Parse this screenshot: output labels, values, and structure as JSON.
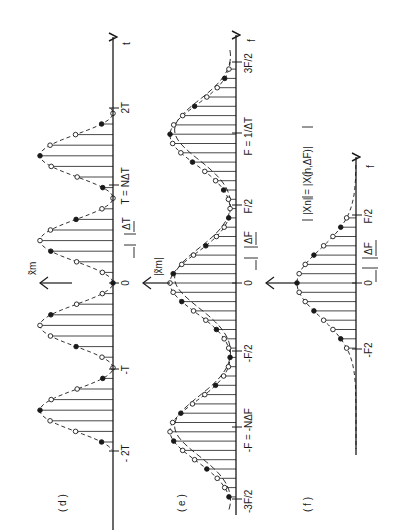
{
  "figure": {
    "orientation": "rotated-90-ccw",
    "ink_color": "#1a1a1a",
    "background": "#ffffff"
  },
  "panels": [
    {
      "id": "d",
      "label": "( d )",
      "y_axis_label": "x̃m",
      "x_axis_label": "t",
      "ticks": [
        {
          "text": "2T",
          "pos": 108
        },
        {
          "text": "T = NΔT",
          "pos": 185
        },
        {
          "text": "0",
          "pos": 283
        },
        {
          "text": "-T",
          "pos": 369
        },
        {
          "text": "- 2T",
          "pos": 451
        }
      ],
      "spacing_label": "ΔT",
      "baseline_x": 113,
      "peak_x": 40,
      "axis_top": 37,
      "axis_bottom": 530,
      "period_px": 85,
      "sample_spacing_px": 10.6
    },
    {
      "id": "e",
      "label": "( e )",
      "y_axis_label": "|x̃m|",
      "x_axis_label": "f",
      "ticks": [
        {
          "text": "3F/2",
          "pos": 62
        },
        {
          "text": "F = 1/ΔT",
          "pos": 133
        },
        {
          "text": "F/2",
          "pos": 205
        },
        {
          "text": "0",
          "pos": 283
        },
        {
          "text": "-F/2",
          "pos": 351
        },
        {
          "text": "-F = -NΔF",
          "pos": 427
        },
        {
          "text": "-3F/2",
          "pos": 499
        }
      ],
      "spacing_label": "ΔF",
      "baseline_x": 236,
      "peak_x": 170,
      "axis_top": 35,
      "axis_bottom": 515,
      "period_px": 148,
      "sample_spacing_px": 9.3
    },
    {
      "id": "f",
      "label": "( f )",
      "y_axis_label": "|Xn| = |X(n,ΔF)|",
      "x_axis_label": "f",
      "ticks": [
        {
          "text": "F/2",
          "pos": 215
        },
        {
          "text": "0",
          "pos": 283
        },
        {
          "text": "-F2",
          "pos": 349
        }
      ],
      "spacing_label": "ΔF",
      "baseline_x": 356,
      "peak_x": 297,
      "axis_top": 157,
      "axis_bottom": 455,
      "sample_spacing_px": 9.3
    }
  ]
}
